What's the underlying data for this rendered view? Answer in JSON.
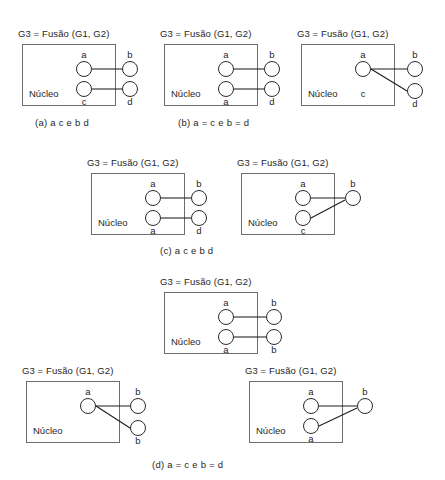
{
  "figure": {
    "page_width": 445,
    "page_height": 480,
    "background": "#ffffff",
    "line_color": "#1c1c1c",
    "box_border_color": "#6d6d6d",
    "node_border_color": "#2b2b2b",
    "text_color": "#1f1f1f",
    "common_title": "G3 = Fusão (G1, G2)",
    "common_nucleus_label": "Núcleo"
  },
  "diagrams": [
    {
      "id": "diagram-a-left",
      "title": "G3 = Fusão (G1, G2)",
      "nucleus_label": "Núcleo",
      "inner_nodes": [
        {
          "id": "in-0",
          "label": "a",
          "label_pos": "top"
        },
        {
          "id": "in-1",
          "label": "c",
          "label_pos": "bottom"
        }
      ],
      "outer_nodes": [
        {
          "id": "out-0",
          "label": "b",
          "label_pos": "top"
        },
        {
          "id": "out-1",
          "label": "d",
          "label_pos": "bottom"
        }
      ],
      "edges": [
        {
          "from": "in-0",
          "to": "out-0"
        },
        {
          "from": "in-1",
          "to": "out-1"
        }
      ]
    },
    {
      "id": "diagram-b-middle",
      "title": "G3 = Fusão (G1, G2)",
      "nucleus_label": "Núcleo",
      "inner_nodes": [
        {
          "id": "in-0",
          "label": "a",
          "label_pos": "top"
        },
        {
          "id": "in-1",
          "label": "a",
          "label_pos": "bottom"
        }
      ],
      "outer_nodes": [
        {
          "id": "out-0",
          "label": "b",
          "label_pos": "top"
        },
        {
          "id": "out-1",
          "label": "d",
          "label_pos": "bottom"
        }
      ],
      "edges": [
        {
          "from": "in-0",
          "to": "out-0"
        },
        {
          "from": "in-1",
          "to": "out-1"
        }
      ]
    },
    {
      "id": "diagram-b-right",
      "title": "G3 = Fusão (G1, G2)",
      "nucleus_label": "Núcleo",
      "inner_nodes": [
        {
          "id": "in-0",
          "label": "a",
          "label_pos": "top"
        }
      ],
      "extra_labels": [
        {
          "id": "lbl-c",
          "label": "c"
        }
      ],
      "outer_nodes": [
        {
          "id": "out-0",
          "label": "b",
          "label_pos": "top"
        },
        {
          "id": "out-1",
          "label": "d",
          "label_pos": "bottom"
        }
      ],
      "edges": [
        {
          "from": "in-0",
          "to": "out-0"
        },
        {
          "from": "in-0",
          "to": "out-1"
        }
      ]
    },
    {
      "id": "diagram-c-left",
      "title": "G3 = Fusão (G1, G2)",
      "nucleus_label": "Núcleo",
      "inner_nodes": [
        {
          "id": "in-0",
          "label": "a",
          "label_pos": "top"
        },
        {
          "id": "in-1",
          "label": "a",
          "label_pos": "bottom"
        }
      ],
      "outer_nodes": [
        {
          "id": "out-0",
          "label": "b",
          "label_pos": "top"
        },
        {
          "id": "out-1",
          "label": "d",
          "label_pos": "bottom"
        }
      ],
      "edges": [
        {
          "from": "in-0",
          "to": "out-0"
        },
        {
          "from": "in-1",
          "to": "out-1"
        }
      ]
    },
    {
      "id": "diagram-c-right",
      "title": "G3 = Fusão (G1, G2)",
      "nucleus_label": "Núcleo",
      "inner_nodes": [
        {
          "id": "in-0",
          "label": "a",
          "label_pos": "top"
        },
        {
          "id": "in-1",
          "label": "c",
          "label_pos": "bottom"
        }
      ],
      "outer_nodes": [
        {
          "id": "out-0",
          "label": "b",
          "label_pos": "top"
        }
      ],
      "edges": [
        {
          "from": "in-0",
          "to": "out-0"
        },
        {
          "from": "in-1",
          "to": "out-0"
        }
      ]
    },
    {
      "id": "diagram-d-center",
      "title": "G3 = Fusão (G1, G2)",
      "nucleus_label": "Núcleo",
      "inner_nodes": [
        {
          "id": "in-0",
          "label": "a",
          "label_pos": "top"
        },
        {
          "id": "in-1",
          "label": "a",
          "label_pos": "bottom"
        }
      ],
      "outer_nodes": [
        {
          "id": "out-0",
          "label": "b",
          "label_pos": "top"
        },
        {
          "id": "out-1",
          "label": "b",
          "label_pos": "bottom"
        }
      ],
      "edges": [
        {
          "from": "in-0",
          "to": "out-0"
        },
        {
          "from": "in-1",
          "to": "out-1"
        }
      ]
    },
    {
      "id": "diagram-d-left",
      "title": "G3 = Fusão (G1, G2)",
      "nucleus_label": "Núcleo",
      "inner_nodes": [
        {
          "id": "in-0",
          "label": "a",
          "label_pos": "top"
        }
      ],
      "outer_nodes": [
        {
          "id": "out-0",
          "label": "b",
          "label_pos": "top"
        },
        {
          "id": "out-1",
          "label": "b",
          "label_pos": "bottom"
        }
      ],
      "edges": [
        {
          "from": "in-0",
          "to": "out-0"
        },
        {
          "from": "in-0",
          "to": "out-1"
        }
      ]
    },
    {
      "id": "diagram-d-right",
      "title": "G3 = Fusão (G1, G2)",
      "nucleus_label": "Núcleo",
      "inner_nodes": [
        {
          "id": "in-0",
          "label": "a",
          "label_pos": "top"
        },
        {
          "id": "in-1",
          "label": "a",
          "label_pos": "bottom"
        }
      ],
      "outer_nodes": [
        {
          "id": "out-0",
          "label": "b",
          "label_pos": "top"
        }
      ],
      "edges": [
        {
          "from": "in-0",
          "to": "out-0"
        },
        {
          "from": "in-1",
          "to": "out-0"
        }
      ]
    }
  ],
  "captions": [
    {
      "id": "caption-a",
      "text": "(a) a  c e b  d"
    },
    {
      "id": "caption-b",
      "text": "(b) a = c e b = d"
    },
    {
      "id": "caption-c",
      "text": "(c) a  c e b  d"
    },
    {
      "id": "caption-d",
      "text": "(d) a = c e b = d"
    }
  ]
}
